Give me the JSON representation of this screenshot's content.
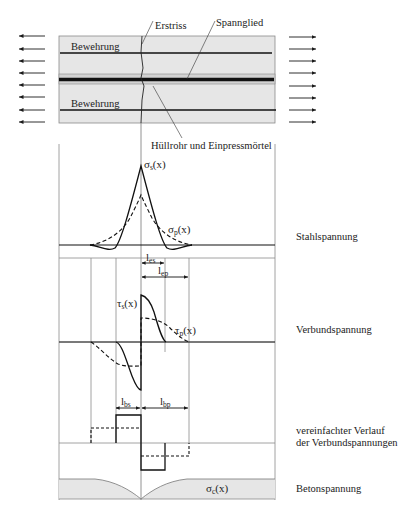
{
  "beam": {
    "labels": {
      "first_crack": "Erstriss",
      "tendon": "Spannglied",
      "reinforcement_top": "Bewehrung",
      "reinforcement_bottom": "Bewehrung",
      "duct_grout": "Hüllrohr und Einpressmörtel"
    },
    "arrow_count_per_side": 8
  },
  "panels": {
    "steel_stress": {
      "title": "Stahlspannung",
      "curve_s": {
        "sym": "σ",
        "sub": "s",
        "arg": "(x)"
      },
      "curve_p": {
        "sym": "σ",
        "sub": "p",
        "arg": "(x)"
      },
      "len_es": {
        "sym": "l",
        "sub": "es"
      },
      "len_ep": {
        "sym": "l",
        "sub": "ep"
      }
    },
    "bond_stress": {
      "title": "Verbundspannung",
      "curve_s": {
        "sym": "τ",
        "sub": "s",
        "arg": "(x)"
      },
      "curve_p": {
        "sym": "τ",
        "sub": "p",
        "arg": "(x)"
      }
    },
    "simplified_bond": {
      "title_line1": "vereinfachter Verlauf",
      "title_line2": "der Verbundspannungen",
      "len_bs": {
        "sym": "l",
        "sub": "bs"
      },
      "len_bp": {
        "sym": "l",
        "sub": "bp"
      }
    },
    "concrete_stress": {
      "title": "Betonspannung",
      "curve_c": {
        "sym": "σ",
        "sub": "c",
        "arg": "(x)"
      }
    }
  },
  "colors": {
    "concrete_fill": "#e6e6e6",
    "line": "#1a1a1a",
    "guide": "#9a9a9a"
  }
}
